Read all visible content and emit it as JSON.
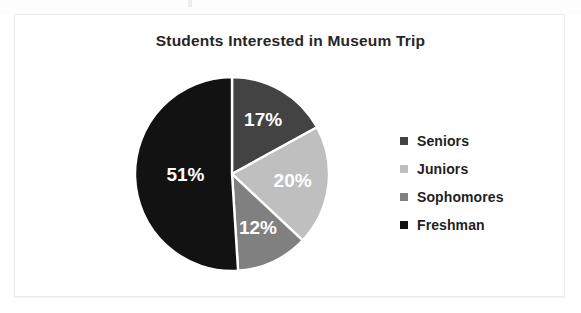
{
  "chart": {
    "title": "Students Interested in Museum Trip",
    "frame_border_color": "#ededed",
    "background": "#ffffff"
  },
  "legend": {
    "position": "right",
    "items": [
      {
        "label": "Seniors",
        "color": "#434343",
        "marker": "square-marker-icon"
      },
      {
        "label": "Juniors",
        "color": "#bfbfbf",
        "marker": "square-marker-icon"
      },
      {
        "label": "Sophomores",
        "color": "#808080",
        "marker": "square-marker-icon"
      },
      {
        "label": "Freshman",
        "color": "#121212",
        "marker": "square-marker-icon"
      }
    ]
  },
  "chart_data": {
    "type": "pie",
    "title": "Students Interested in Museum Trip",
    "xlabel": "",
    "ylabel": "",
    "grid": false,
    "legend_position": "right",
    "start_angle_deg": 0,
    "direction": "clockwise",
    "categories": [
      "Seniors",
      "Juniors",
      "Sophomores",
      "Freshman"
    ],
    "values": [
      17,
      20,
      12,
      51
    ],
    "value_unit": "%",
    "colors": [
      "#434343",
      "#bfbfbf",
      "#808080",
      "#121212"
    ],
    "data_labels": [
      "17%",
      "20%",
      "12%",
      "51%"
    ],
    "data_label_color": "#ffffff",
    "slices": [
      {
        "name": "Seniors",
        "value": 17,
        "label": "17%",
        "color": "#434343"
      },
      {
        "name": "Juniors",
        "value": 20,
        "label": "20%",
        "color": "#bfbfbf"
      },
      {
        "name": "Sophomores",
        "value": 12,
        "label": "12%",
        "color": "#808080"
      },
      {
        "name": "Freshman",
        "value": 51,
        "label": "51%",
        "color": "#121212"
      }
    ]
  }
}
